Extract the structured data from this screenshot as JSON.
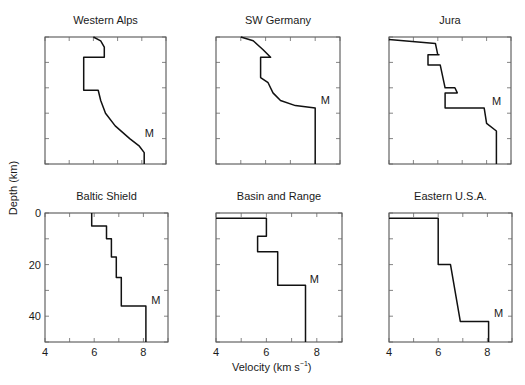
{
  "figure": {
    "ylabel": "Depth (km)",
    "xlabel_main": "Velocity (km s",
    "xlabel_sup": "−1",
    "xlabel_close": ")"
  },
  "chart_data": [
    {
      "type": "line",
      "title": "Western Alps",
      "xlabel": "Velocity (km s^-1)",
      "ylabel": "Depth (km)",
      "xlim": [
        4,
        9
      ],
      "ylim": [
        0,
        50
      ],
      "y_inverted": true,
      "xticks": [
        4,
        5,
        6,
        7,
        8,
        9
      ],
      "yticks": [
        0,
        10,
        20,
        30,
        40,
        50
      ],
      "xticklabels_shown": false,
      "yticklabels_shown": true,
      "annotation": {
        "text": "M",
        "x": 8.0,
        "y": 40
      },
      "frame": [
        45,
        37,
        166,
        164
      ],
      "points": [
        [
          6.0,
          0
        ],
        [
          6.3,
          1.5
        ],
        [
          6.45,
          4
        ],
        [
          6.45,
          8
        ],
        [
          5.6,
          8
        ],
        [
          5.6,
          21
        ],
        [
          6.2,
          21
        ],
        [
          6.3,
          25
        ],
        [
          6.5,
          30
        ],
        [
          6.9,
          35
        ],
        [
          7.5,
          40
        ],
        [
          7.9,
          43
        ],
        [
          8.1,
          45.5
        ],
        [
          8.1,
          50
        ]
      ]
    },
    {
      "type": "line",
      "title": "SW Germany",
      "xlim": [
        4,
        9
      ],
      "ylim": [
        0,
        50
      ],
      "y_inverted": true,
      "xticks": [
        4,
        5,
        6,
        7,
        8,
        9
      ],
      "yticks": [
        0,
        10,
        20,
        30,
        40,
        50
      ],
      "xticklabels_shown": false,
      "yticklabels_shown": false,
      "annotation": {
        "text": "M",
        "x": 8.1,
        "y": 27
      },
      "frame": [
        216,
        37,
        340,
        164
      ],
      "points": [
        [
          5.0,
          0
        ],
        [
          5.5,
          1.5
        ],
        [
          5.9,
          5
        ],
        [
          6.2,
          8
        ],
        [
          5.8,
          8
        ],
        [
          5.8,
          16
        ],
        [
          6.1,
          18
        ],
        [
          6.3,
          22
        ],
        [
          6.6,
          25
        ],
        [
          7.2,
          27
        ],
        [
          8.0,
          28
        ],
        [
          8.0,
          50
        ]
      ]
    },
    {
      "type": "line",
      "title": "Jura",
      "xlim": [
        4,
        9
      ],
      "ylim": [
        0,
        50
      ],
      "y_inverted": true,
      "xticks": [
        4,
        5,
        6,
        7,
        8,
        9
      ],
      "yticks": [
        0,
        10,
        20,
        30,
        40,
        50
      ],
      "xticklabels_shown": false,
      "yticklabels_shown": false,
      "annotation": {
        "text": "M",
        "x": 8.1,
        "y": 27.5
      },
      "frame": [
        389,
        37,
        511,
        164
      ],
      "points": [
        [
          4.0,
          1
        ],
        [
          5.9,
          2.5
        ],
        [
          6.0,
          7
        ],
        [
          6.05,
          7
        ],
        [
          5.6,
          7
        ],
        [
          5.6,
          11
        ],
        [
          6.1,
          11
        ],
        [
          6.3,
          20
        ],
        [
          6.7,
          20
        ],
        [
          6.8,
          22
        ],
        [
          6.3,
          22
        ],
        [
          6.3,
          28
        ],
        [
          7.9,
          28
        ],
        [
          8.0,
          34
        ],
        [
          8.4,
          37
        ],
        [
          8.4,
          50
        ]
      ]
    },
    {
      "type": "line",
      "title": "Baltic Shield",
      "xlim": [
        4,
        9
      ],
      "ylim": [
        0,
        50
      ],
      "y_inverted": true,
      "xticks": [
        4,
        5,
        6,
        7,
        8,
        9
      ],
      "yticks": [
        0,
        10,
        20,
        30,
        40,
        50
      ],
      "xticklabels": [
        "4",
        "6",
        "8"
      ],
      "yticklabels": [
        "0",
        "20",
        "40"
      ],
      "annotation": {
        "text": "M",
        "x": 8.2,
        "y": 36
      },
      "frame": [
        45,
        213,
        168,
        342
      ],
      "points": [
        [
          5.9,
          0
        ],
        [
          5.9,
          5
        ],
        [
          6.5,
          5
        ],
        [
          6.5,
          10
        ],
        [
          6.7,
          10
        ],
        [
          6.7,
          17
        ],
        [
          6.9,
          17
        ],
        [
          6.9,
          25
        ],
        [
          7.1,
          25
        ],
        [
          7.1,
          36
        ],
        [
          8.1,
          36
        ],
        [
          8.1,
          50
        ]
      ]
    },
    {
      "type": "line",
      "title": "Basin and Range",
      "xlim": [
        4,
        9
      ],
      "ylim": [
        0,
        50
      ],
      "y_inverted": true,
      "xticks": [
        4,
        5,
        6,
        7,
        8,
        9
      ],
      "yticks": [
        0,
        10,
        20,
        30,
        40,
        50
      ],
      "xticklabels": [
        "4",
        "6",
        "8"
      ],
      "annotation": {
        "text": "M",
        "x": 7.6,
        "y": 28
      },
      "frame": [
        216,
        213,
        342,
        342
      ],
      "points": [
        [
          4.0,
          2
        ],
        [
          6.0,
          2
        ],
        [
          6.0,
          9
        ],
        [
          5.65,
          9
        ],
        [
          5.65,
          15
        ],
        [
          6.45,
          15
        ],
        [
          6.45,
          28
        ],
        [
          7.55,
          28
        ],
        [
          7.55,
          50
        ]
      ]
    },
    {
      "type": "line",
      "title": "Eastern U.S.A.",
      "xlim": [
        4,
        9
      ],
      "ylim": [
        0,
        50
      ],
      "y_inverted": true,
      "xticks": [
        4,
        5,
        6,
        7,
        8,
        9
      ],
      "yticks": [
        0,
        10,
        20,
        30,
        40,
        50
      ],
      "xticklabels": [
        "4",
        "6",
        "8"
      ],
      "annotation": {
        "text": "M",
        "x": 8.15,
        "y": 41
      },
      "frame": [
        389,
        213,
        512,
        342
      ],
      "points": [
        [
          4.0,
          2
        ],
        [
          6.0,
          2
        ],
        [
          6.0,
          20
        ],
        [
          6.5,
          20
        ],
        [
          6.9,
          42
        ],
        [
          8.05,
          42
        ],
        [
          8.05,
          50
        ]
      ]
    }
  ]
}
